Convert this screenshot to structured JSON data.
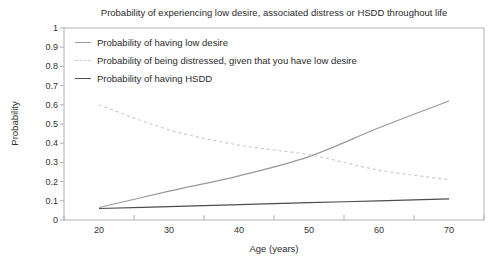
{
  "figure": {
    "title": "Probability of experiencing low desire, associated distress or HSDD throughout life",
    "xlabel": "Age (years)",
    "ylabel": "Probability"
  },
  "colors": {
    "axis": "#b3b3b3",
    "text": "#2b2b2b",
    "background": "#ffffff"
  },
  "chart_data": {
    "type": "line",
    "title": "Probability of experiencing low desire, associated distress or HSDD throughout life",
    "xlabel": "Age (years)",
    "ylabel": "Probability",
    "x": [
      20,
      30,
      40,
      50,
      60,
      70
    ],
    "x_tick_labels": [
      "20",
      "30",
      "40",
      "50",
      "60",
      "70"
    ],
    "y_tick_labels": [
      "0",
      "0.1",
      "0.2",
      "0.3",
      "0.4",
      "0.5",
      "0.6",
      "0.7",
      "0.8",
      "0.9",
      "1"
    ],
    "ylim": [
      0,
      1
    ],
    "ytick_step": 0.1,
    "grid": false,
    "legend_position": "top-left-inside",
    "series": [
      {
        "key": "low-desire",
        "name": "Probability of having low desire",
        "style": "solid",
        "color": "#999999",
        "values": [
          0.065,
          0.15,
          0.23,
          0.33,
          0.48,
          0.62
        ]
      },
      {
        "key": "distressed-given-low-desire",
        "name": "Probability of being distressed, given that you have low desire",
        "style": "dashed",
        "color": "#cccccc",
        "values": [
          0.6,
          0.47,
          0.39,
          0.34,
          0.26,
          0.21
        ]
      },
      {
        "key": "hsdd",
        "name": "Probability of having HSDD",
        "style": "solid",
        "color": "#4d4d4d",
        "values": [
          0.06,
          0.07,
          0.08,
          0.09,
          0.1,
          0.11
        ]
      }
    ]
  }
}
